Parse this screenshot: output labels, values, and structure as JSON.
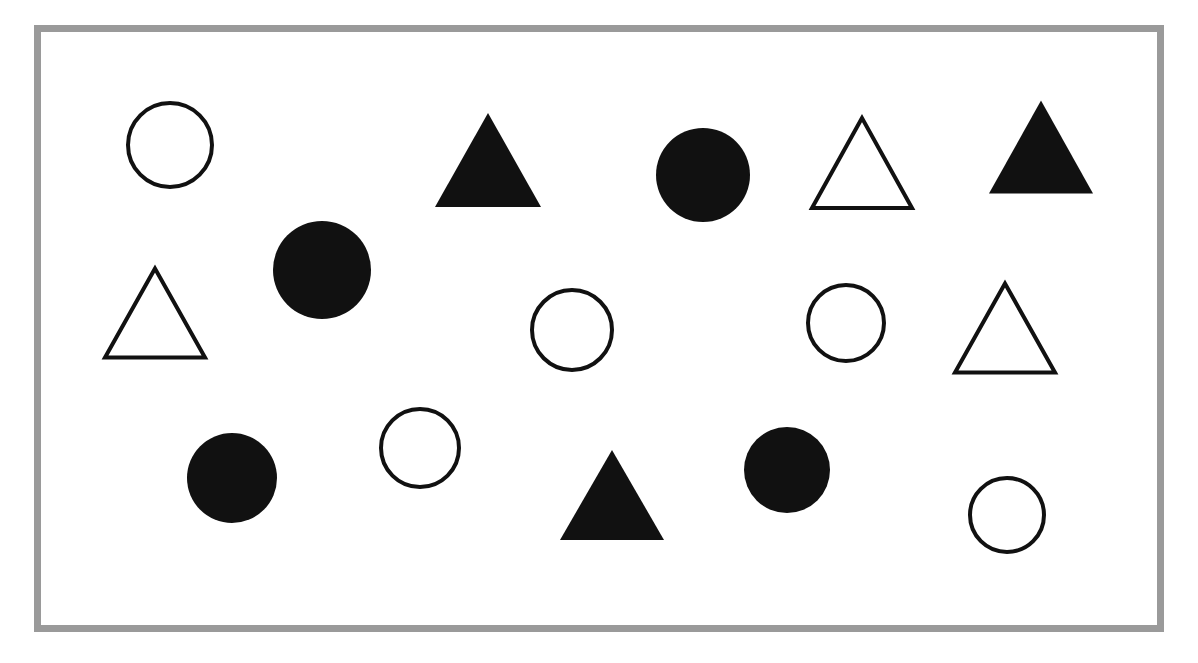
{
  "figure": {
    "title": "",
    "background_color": "#ffffff",
    "frame": {
      "border_color": "#9a9a9a",
      "border_width": 7,
      "x": 34,
      "y": 25,
      "width": 1130,
      "height": 607,
      "fill_color": "#ffffff"
    },
    "shape_fill_color": "#111111",
    "shape_outline_color": "#111111",
    "outline_stroke_width": 4
  },
  "chart_data": {
    "type": "scatter",
    "title": "",
    "xlabel": "",
    "ylabel": "",
    "legend": [],
    "summary": {
      "total_shapes": 16,
      "circles": 9,
      "triangles": 7,
      "filled_shapes": 8,
      "outlined_shapes": 8,
      "filled_circles": 4,
      "outlined_circles": 5,
      "filled_triangles": 3,
      "outlined_triangles": 4
    },
    "shapes": [
      {
        "id": "shape-1",
        "kind": "circle",
        "style": "outline",
        "cx": 170,
        "cy": 145,
        "r": 44,
        "row": 1
      },
      {
        "id": "shape-2",
        "kind": "triangle",
        "style": "filled",
        "cx": 488,
        "cy": 160,
        "half_base": 53,
        "height": 94,
        "row": 1
      },
      {
        "id": "shape-3",
        "kind": "circle",
        "style": "filled",
        "cx": 703,
        "cy": 175,
        "r": 47,
        "row": 1
      },
      {
        "id": "shape-4",
        "kind": "triangle",
        "style": "outline",
        "cx": 862,
        "cy": 163,
        "half_base": 50,
        "height": 90,
        "row": 1
      },
      {
        "id": "shape-5",
        "kind": "triangle",
        "style": "filled",
        "cx": 1041,
        "cy": 147,
        "half_base": 52,
        "height": 93,
        "row": 1
      },
      {
        "id": "shape-6",
        "kind": "circle",
        "style": "filled",
        "cx": 322,
        "cy": 270,
        "r": 49,
        "row": 2
      },
      {
        "id": "shape-7",
        "kind": "triangle",
        "style": "outline",
        "cx": 155,
        "cy": 313,
        "half_base": 50,
        "height": 89,
        "row": 2
      },
      {
        "id": "shape-8",
        "kind": "circle",
        "style": "outline",
        "cx": 572,
        "cy": 330,
        "r": 42,
        "row": 2
      },
      {
        "id": "shape-9",
        "kind": "circle",
        "style": "outline",
        "cx": 846,
        "cy": 323,
        "r": 40,
        "row": 2
      },
      {
        "id": "shape-10",
        "kind": "triangle",
        "style": "outline",
        "cx": 1005,
        "cy": 328,
        "half_base": 50,
        "height": 89,
        "row": 2
      },
      {
        "id": "shape-11",
        "kind": "circle",
        "style": "filled",
        "cx": 232,
        "cy": 478,
        "r": 45,
        "row": 3
      },
      {
        "id": "shape-12",
        "kind": "circle",
        "style": "outline",
        "cx": 420,
        "cy": 448,
        "r": 41,
        "row": 3
      },
      {
        "id": "shape-13",
        "kind": "triangle",
        "style": "filled",
        "cx": 612,
        "cy": 495,
        "half_base": 52,
        "height": 90,
        "row": 3
      },
      {
        "id": "shape-14",
        "kind": "circle",
        "style": "filled",
        "cx": 787,
        "cy": 470,
        "r": 43,
        "row": 3
      },
      {
        "id": "shape-15",
        "kind": "circle",
        "style": "outline",
        "cx": 1007,
        "cy": 515,
        "r": 39,
        "row": 3
      }
    ]
  }
}
